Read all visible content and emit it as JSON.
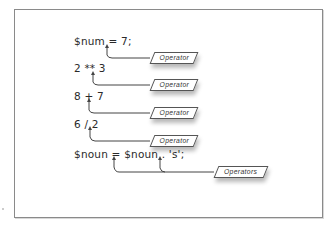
{
  "diagram": {
    "expressions": [
      {
        "id": "assign",
        "text": "$num = 7;",
        "callout": "Operator"
      },
      {
        "id": "power",
        "text": "2 ** 3",
        "callout": "Operator"
      },
      {
        "id": "add",
        "text": "8 + 7",
        "callout": "Operator"
      },
      {
        "id": "divide",
        "text": "6 / 2",
        "callout": "Operator"
      },
      {
        "id": "concat",
        "text": "$noun = $noun . 's';",
        "callout": "Operators"
      }
    ],
    "colors": {
      "frame": "#8a8a8a",
      "line": "#444444",
      "text": "#2a2a2a"
    }
  }
}
